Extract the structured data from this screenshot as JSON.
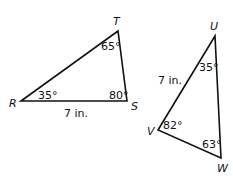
{
  "triangles": [
    {
      "name": "RST",
      "vertices": {
        "R": "R",
        "S": "S",
        "T": "T"
      },
      "angles": {
        "R": "35°",
        "S": "80°",
        "T": "65°"
      },
      "side_label": "7 in."
    },
    {
      "name": "UVW",
      "vertices": {
        "U": "U",
        "V": "V",
        "W": "W"
      },
      "angles": {
        "U": "35°",
        "V": "82°",
        "W": "63°"
      },
      "side_label": "7 in."
    }
  ],
  "colors": {
    "stroke": "#111111",
    "background": "#ffffff"
  }
}
